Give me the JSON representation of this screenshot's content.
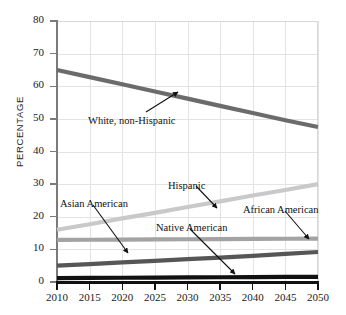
{
  "chart_data": {
    "type": "line",
    "title": "",
    "xlabel": "",
    "ylabel": "PERCENTAGE",
    "x": [
      2010,
      2015,
      2020,
      2025,
      2030,
      2035,
      2040,
      2045,
      2050
    ],
    "xtick_labels": [
      "2010",
      "2015",
      "2020",
      "2025",
      "2030",
      "2035",
      "2040",
      "2045",
      "2050"
    ],
    "ytick_labels": [
      "0",
      "10",
      "20",
      "30",
      "40",
      "50",
      "60",
      "70",
      "80"
    ],
    "yticks": [
      0,
      10,
      20,
      30,
      40,
      50,
      60,
      70,
      80
    ],
    "xlim": [
      2010,
      2050
    ],
    "ylim": [
      0,
      80
    ],
    "grid": true,
    "legend": "inline-annotations",
    "series": [
      {
        "name": "White, non-Hispanic",
        "color": "#6b6b6b",
        "width": 4.2,
        "values": [
          65.0,
          62.8,
          60.6,
          58.4,
          56.2,
          54.0,
          51.8,
          49.6,
          47.5
        ]
      },
      {
        "name": "Hispanic",
        "color": "#c9c9c9",
        "width": 4.2,
        "values": [
          16.0,
          17.7,
          19.5,
          21.2,
          23.0,
          24.7,
          26.5,
          28.2,
          30.0
        ]
      },
      {
        "name": "African American",
        "color": "#a3a3a3",
        "width": 4.2,
        "values": [
          12.9,
          12.95,
          13.0,
          13.05,
          13.1,
          13.15,
          13.2,
          13.25,
          13.3
        ]
      },
      {
        "name": "Asian American",
        "color": "#565656",
        "width": 4.2,
        "values": [
          5.0,
          5.5,
          6.0,
          6.5,
          7.0,
          7.5,
          8.0,
          8.6,
          9.2
        ]
      },
      {
        "name": "Native American",
        "color": "#111111",
        "width": 4.2,
        "values": [
          1.2,
          1.25,
          1.3,
          1.35,
          1.4,
          1.45,
          1.5,
          1.55,
          1.6
        ]
      }
    ],
    "annotations": [
      {
        "key": "white",
        "text": "White, non-Hispanic",
        "label_x": 88,
        "label_y": 115,
        "arrow_x1": 146,
        "arrow_y1": 112,
        "arrow_x2": 178,
        "arrow_y2": 92
      },
      {
        "key": "hispanic",
        "text": "Hispanic",
        "label_x": 168,
        "label_y": 180,
        "arrow_x1": 196,
        "arrow_y1": 186,
        "arrow_x2": 217,
        "arrow_y2": 208
      },
      {
        "key": "asian",
        "text": "Asian American",
        "label_x": 60,
        "label_y": 198,
        "arrow_x1": 93,
        "arrow_y1": 205,
        "arrow_x2": 128,
        "arrow_y2": 253
      },
      {
        "key": "native",
        "text": "Native American",
        "label_x": 156,
        "label_y": 222,
        "arrow_x1": 190,
        "arrow_y1": 229,
        "arrow_x2": 235,
        "arrow_y2": 274
      },
      {
        "key": "african",
        "text": "African American",
        "label_x": 243,
        "label_y": 204,
        "arrow_x1": 285,
        "arrow_y1": 211,
        "arrow_x2": 309,
        "arrow_y2": 239
      }
    ]
  }
}
